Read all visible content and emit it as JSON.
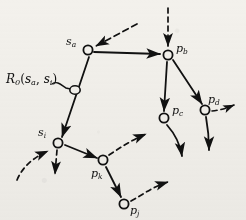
{
  "figure": {
    "type": "node-link-diagram",
    "background_color": "#f3f1ec",
    "ink_color": "#111111",
    "width": 246,
    "height": 220
  },
  "nodes": [
    {
      "id": "s_a",
      "base": "s",
      "sub": "a",
      "x": 88,
      "y": 50,
      "label_dx": -22,
      "label_dy": -14
    },
    {
      "id": "p_b",
      "base": "p",
      "sub": "b",
      "x": 168,
      "y": 55,
      "label_dx": 8,
      "label_dy": -12
    },
    {
      "id": "rel",
      "base": "",
      "sub": "",
      "x": 75,
      "y": 90,
      "label_dx": 0,
      "label_dy": 0
    },
    {
      "id": "s_i",
      "base": "s",
      "sub": "i",
      "x": 58,
      "y": 143,
      "label_dx": -20,
      "label_dy": -16
    },
    {
      "id": "p_c",
      "base": "p",
      "sub": "c",
      "x": 164,
      "y": 118,
      "label_dx": 8,
      "label_dy": -13
    },
    {
      "id": "p_d",
      "base": "p",
      "sub": "d",
      "x": 205,
      "y": 110,
      "label_dx": 3,
      "label_dy": -16
    },
    {
      "id": "p_k",
      "base": "p",
      "sub": "k",
      "x": 103,
      "y": 160,
      "label_dx": -12,
      "label_dy": 8
    },
    {
      "id": "p_j",
      "base": "p",
      "sub": "j",
      "x": 124,
      "y": 204,
      "label_dx": 6,
      "label_dy": 1
    }
  ],
  "relation_label": {
    "base": "R",
    "sub0": "0",
    "open": "(",
    "arg1_base": "s",
    "arg1_sub": "a",
    "comma": ", ",
    "arg2_base": "s",
    "arg2_sub": "i",
    "close": ")",
    "x": 6,
    "y": 73
  },
  "edges": [
    {
      "name": "edge-sa-pb",
      "style": "solid",
      "from": "s_a",
      "to": "p_b"
    },
    {
      "name": "edge-sa-si",
      "style": "solid",
      "from": "s_a",
      "to": "s_i"
    },
    {
      "name": "edge-pb-pc",
      "style": "solid",
      "from": "p_b",
      "to": "p_c"
    },
    {
      "name": "edge-pb-pd",
      "style": "solid",
      "from": "p_b",
      "to": "p_d"
    },
    {
      "name": "edge-si-pk",
      "style": "solid",
      "from": "s_i",
      "to": "p_k"
    },
    {
      "name": "edge-pk-pj",
      "style": "solid",
      "from": "p_k",
      "to": "p_j"
    }
  ],
  "incoming_arrows": [
    {
      "name": "dashed-inbound-sa",
      "style": "dashed",
      "target": "s_a"
    },
    {
      "name": "dashed-inbound-pb",
      "style": "dashed",
      "target": "p_b"
    },
    {
      "name": "dashed-inbound-si",
      "style": "dashed",
      "target": "s_i"
    }
  ],
  "outgoing_arrows": [
    {
      "name": "dashed-outbound-si",
      "style": "dashed",
      "source": "s_i"
    },
    {
      "name": "dashed-outbound-pk",
      "style": "dashed",
      "source": "p_k"
    },
    {
      "name": "dashed-outbound-pj",
      "style": "dashed",
      "source": "p_j"
    },
    {
      "name": "dashed-outbound-pd",
      "style": "dashed",
      "source": "p_d"
    },
    {
      "name": "solid-outbound-pc",
      "style": "solid",
      "source": "p_c"
    },
    {
      "name": "solid-outbound-pd",
      "style": "solid",
      "source": "p_d"
    }
  ]
}
